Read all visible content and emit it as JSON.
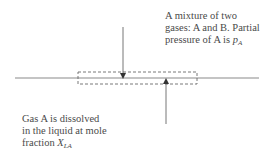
{
  "diagram": {
    "gas_label": {
      "line1": "A mixture of two",
      "line2": "gases: A and B. Partial",
      "line3_prefix": "pressure of A is ",
      "symbol": "p",
      "subscript": "A"
    },
    "liquid_label": {
      "line1": "Gas A is dissolved",
      "line2": "in the liquid at mole",
      "line3_prefix": "fraction ",
      "symbol": "X",
      "subscript": "LA"
    },
    "elements": {
      "interface_line": "gas-liquid interface",
      "control_volume": "dashed control volume box",
      "arrow_down": "gas phase arrow pointing to interface",
      "arrow_up": "liquid phase arrow pointing to interface"
    },
    "colors": {
      "line": "#8a8a8a",
      "arrow": "#555555",
      "text": "#4a4a4a"
    }
  }
}
